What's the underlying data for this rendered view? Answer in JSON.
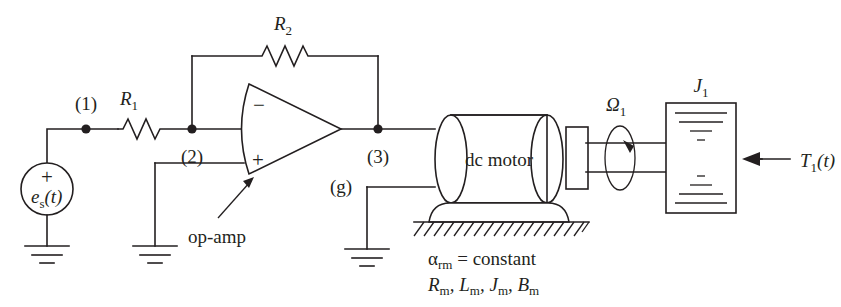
{
  "figure": {
    "domain": "diagram",
    "width": 841,
    "height": 307,
    "background": "#ffffff",
    "ink": "#231f20"
  },
  "labels": {
    "node1": "(1)",
    "node2": "(2)",
    "node3": "(3)",
    "node_g": "(g)",
    "resistor1_name": "R",
    "resistor1_sub": "1",
    "resistor2_name": "R",
    "resistor2_sub": "2",
    "source_name": "e",
    "source_sub": "s",
    "source_arg": "(t)",
    "source_polarity": "+",
    "opamp_inverting": "−",
    "opamp_noninverting": "+",
    "opamp_callout": "op-amp",
    "motor_body": "dc motor",
    "speed_name": "Ω",
    "speed_sub": "1",
    "inertia_name": "J",
    "inertia_sub": "1",
    "torque_name": "T",
    "torque_sub": "1",
    "torque_arg": "(t)",
    "motor_params_line1_alpha": "α",
    "motor_params_line1_sub": "rm",
    "motor_params_line1_rest": "= constant",
    "motor_params_line2": [
      {
        "name": "R",
        "sub": "m",
        "sep": ", "
      },
      {
        "name": "L",
        "sub": "m",
        "sep": ", "
      },
      {
        "name": "J",
        "sub": "m",
        "sep": ", "
      },
      {
        "name": "B",
        "sub": "m",
        "sep": ""
      }
    ]
  },
  "components": {
    "voltage_source": {
      "kind": "circle-source",
      "cx": 47,
      "cy": 189,
      "r": 26
    },
    "resistor_r1": {
      "kind": "zigzag-resistor",
      "x1": 118,
      "x2": 160,
      "y": 129
    },
    "resistor_r2": {
      "kind": "zigzag-resistor",
      "x1": 262,
      "x2": 308,
      "y": 56
    },
    "opamp": {
      "kind": "triangle-amplifier",
      "left": 245,
      "top": 84,
      "bottom": 174,
      "apex_x": 341,
      "apex_y": 129
    },
    "motor": {
      "kind": "cylinder",
      "left": 435,
      "right": 563,
      "top": 115,
      "bottom": 203
    },
    "motor_bearing": {
      "kind": "box",
      "x": 568,
      "y": 126,
      "w": 20,
      "h": 54
    },
    "shaft": {
      "kind": "double-line",
      "x1": 583,
      "x2": 667,
      "y_top": 143,
      "y_bottom": 172
    },
    "rotation_indicator": {
      "kind": "ellipse-arrow",
      "cx": 620,
      "cy": 158,
      "rx": 16,
      "ry": 32
    },
    "load_inertia": {
      "kind": "section-block",
      "x": 666,
      "y": 103,
      "w": 70,
      "h": 110
    },
    "grounds": [
      {
        "id": "source-ground",
        "x": 47,
        "y": 246
      },
      {
        "id": "noninverting-ground",
        "x": 155,
        "y": 246
      },
      {
        "id": "g-node-ground",
        "x": 367,
        "y": 249
      }
    ],
    "fixed_support": {
      "kind": "hatched-ground",
      "x1": 414,
      "x2": 589,
      "y": 222
    }
  },
  "connections": [
    {
      "from": "source+",
      "to": "node1"
    },
    {
      "from": "node1",
      "to": "resistor_r1"
    },
    {
      "from": "resistor_r1",
      "to": "node2"
    },
    {
      "from": "node2",
      "to": "opamp_inverting_input"
    },
    {
      "from": "node2",
      "to": "resistor_r2_left"
    },
    {
      "from": "resistor_r2_right",
      "to": "node3"
    },
    {
      "from": "opamp_output",
      "to": "node3"
    },
    {
      "from": "node3",
      "to": "motor_terminal_top"
    },
    {
      "from": "node_g",
      "to": "motor_terminal_bottom"
    },
    {
      "from": "node_g",
      "to": "g-node-ground"
    },
    {
      "from": "noninverting_input",
      "to": "noninverting-ground"
    },
    {
      "from": "motor_shaft",
      "to": "load_inertia"
    }
  ]
}
